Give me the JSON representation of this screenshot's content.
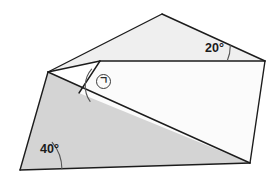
{
  "figure": {
    "type": "geometry-diagram",
    "canvas": {
      "width": 280,
      "height": 177,
      "background": "#ffffff"
    },
    "colors": {
      "stroke": "#1c1c1c",
      "upper_plane_fill": "#efefef",
      "lower_plane_fill": "#d4d4d4",
      "inner_face_fill": "#fbfbfb",
      "label_text": "#1b1b1b",
      "arc_stroke": "#555555"
    },
    "stroke_width": 1.4,
    "shapes": [
      {
        "name": "upper-plane",
        "label": "upper tilted plane",
        "fill": "#efefef",
        "points": "162,14 265,61 100,61 48,72"
      },
      {
        "name": "lower-plane",
        "label": "lower base plane",
        "fill": "#d4d4d4",
        "points": "48,72 250,163 20,170"
      },
      {
        "name": "inner-face",
        "label": "front white face",
        "fill": "#fbfbfb",
        "points": "100,61 265,61 250,163 79,93"
      }
    ],
    "vertices": [
      {
        "name": "top-apex",
        "x": 162,
        "y": 14
      },
      {
        "name": "right-corner",
        "x": 265,
        "y": 61
      },
      {
        "name": "inner-top-left-corner",
        "x": 100,
        "y": 61
      },
      {
        "name": "left-corner",
        "x": 48,
        "y": 72
      },
      {
        "name": "bottom-left-corner",
        "x": 20,
        "y": 170
      },
      {
        "name": "bottom-right-corner",
        "x": 250,
        "y": 163
      },
      {
        "name": "fold-vertex",
        "x": 79,
        "y": 93
      }
    ],
    "edges": [
      {
        "name": "apex-to-right",
        "from": "162,14",
        "to": "265,61"
      },
      {
        "name": "apex-to-left",
        "from": "162,14",
        "to": "48,72"
      },
      {
        "name": "top-ridge",
        "from": "100,61",
        "to": "265,61"
      },
      {
        "name": "right-side",
        "from": "265,61",
        "to": "250,163"
      },
      {
        "name": "bottom-edge",
        "from": "20,170",
        "to": "250,163"
      },
      {
        "name": "left-slant",
        "from": "48,72",
        "to": "20,170"
      },
      {
        "name": "fold-line",
        "from": "48,72",
        "to": "250,163"
      },
      {
        "name": "inner-left-slant",
        "from": "100,61",
        "to": "79,93"
      }
    ],
    "angles": [
      {
        "name": "angle-20",
        "value": 20,
        "text": "20°",
        "vertex": {
          "x": 265,
          "y": 61
        },
        "arc": {
          "cx": 265,
          "cy": 61,
          "radius": 38,
          "start_deg": 180,
          "sweep_deg": 24
        },
        "label_position": {
          "left": 205,
          "top": 42
        }
      },
      {
        "name": "angle-40",
        "value": 40,
        "text": "40°",
        "vertex": {
          "x": 20,
          "y": 170
        },
        "arc": {
          "cx": 20,
          "cy": 170,
          "radius": 42,
          "start_deg": 0,
          "sweep_deg": 40
        },
        "label_position": {
          "left": 40,
          "top": 143
        }
      },
      {
        "name": "angle-unknown",
        "value": null,
        "text": "ㄱ",
        "vertex": {
          "x": 79,
          "y": 93
        },
        "arc": {
          "cx": 79,
          "cy": 93,
          "radius": 26,
          "start_deg": 0,
          "sweep_deg": 0
        },
        "label_position": {
          "left": 96,
          "top": 74
        },
        "is_unknown_marker": true
      }
    ],
    "labels": {
      "angle_20_text": "20°",
      "angle_40_text": "40°",
      "unknown_mark_text": "ㄱ"
    }
  }
}
